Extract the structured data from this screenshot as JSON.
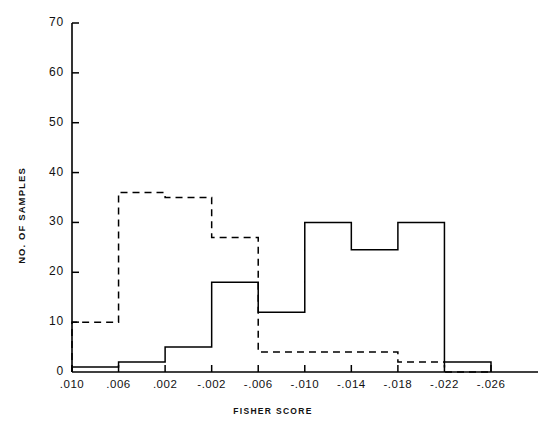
{
  "chart_data": {
    "type": "line",
    "subtype": "step-histogram",
    "title": "",
    "xlabel": "FISHER SCORE",
    "ylabel": "NO. OF SAMPLES",
    "xlim": [
      0.01,
      -0.026
    ],
    "ylim": [
      0,
      70
    ],
    "x_inverted": true,
    "grid": false,
    "legend": "none",
    "x_tick_labels": [
      ".010",
      ".006",
      ".002",
      "-.002",
      "-.006",
      "-.010",
      "-.014",
      "-.018",
      "-.022",
      "-.026"
    ],
    "x_tick_values": [
      0.01,
      0.006,
      0.002,
      -0.002,
      -0.006,
      -0.01,
      -0.014,
      -0.018,
      -0.022,
      -0.026
    ],
    "y_tick_labels": [
      "0",
      "10",
      "20",
      "30",
      "40",
      "50",
      "60",
      "70"
    ],
    "y_tick_values": [
      0,
      10,
      20,
      30,
      40,
      50,
      60,
      70
    ],
    "bin_edges": [
      0.01,
      0.006,
      0.002,
      -0.002,
      -0.006,
      -0.01,
      -0.014,
      -0.018,
      -0.022,
      -0.026
    ],
    "series": [
      {
        "name": "solid",
        "style": "solid",
        "color": "#000000",
        "values": [
          1,
          2,
          5,
          18,
          12,
          30,
          24.5,
          30,
          2
        ]
      },
      {
        "name": "dashed",
        "style": "dashed",
        "color": "#000000",
        "values": [
          10,
          36,
          35,
          27,
          4,
          4,
          4,
          2,
          0
        ]
      }
    ]
  },
  "axes": {
    "y_axis_name": "no-of-samples-axis",
    "x_axis_name": "fisher-score-axis"
  }
}
